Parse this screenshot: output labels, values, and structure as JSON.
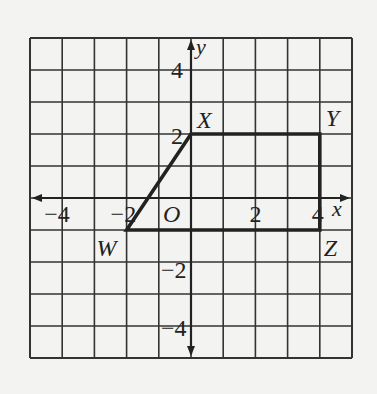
{
  "figure": {
    "grid": {
      "xmin": -5,
      "xmax": 5,
      "ymin": -5,
      "ymax": 5,
      "step": 1
    },
    "axes": {
      "x_label": "x",
      "y_label": "y",
      "origin_label": "O"
    },
    "tick_labels": {
      "x": [
        {
          "value": -4,
          "text": "−4"
        },
        {
          "value": -2,
          "text": "−2"
        },
        {
          "value": 2,
          "text": "2"
        },
        {
          "value": 4,
          "text": "4"
        }
      ],
      "y": [
        {
          "value": 4,
          "text": "4"
        },
        {
          "value": 2,
          "text": "2"
        },
        {
          "value": -2,
          "text": "−2"
        },
        {
          "value": -4,
          "text": "−4"
        }
      ]
    },
    "polygon": {
      "name": "WXYZ",
      "vertices": [
        {
          "label": "W",
          "x": -2,
          "y": -1
        },
        {
          "label": "X",
          "x": 0,
          "y": 2
        },
        {
          "label": "Y",
          "x": 4,
          "y": 2
        },
        {
          "label": "Z",
          "x": 4,
          "y": -1
        }
      ]
    },
    "colors": {
      "line": "#222222",
      "grid": "#333333",
      "background": "#f3f3f1"
    }
  }
}
